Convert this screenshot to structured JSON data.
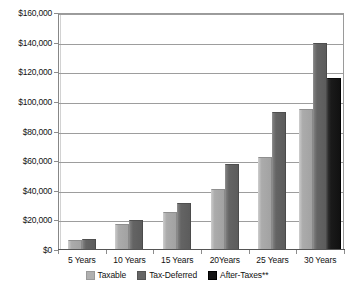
{
  "chart_data": {
    "type": "bar",
    "title": "",
    "subtitle": "",
    "xlabel": "",
    "ylabel": "",
    "categories": [
      "5 Years",
      "10 Years",
      "15 Years",
      "20Years",
      "25 Years",
      "30 Years"
    ],
    "series": [
      {
        "name": "Taxable",
        "color": "#a8a8a8",
        "values": [
          7000,
          17500,
          26000,
          41000,
          63000,
          95000
        ]
      },
      {
        "name": "Tax-Deferred",
        "color": "#646464",
        "values": [
          7500,
          20000,
          32000,
          58000,
          93000,
          140000
        ]
      },
      {
        "name": "After-Taxes**",
        "color": "#1a1a1a",
        "values": [
          null,
          null,
          null,
          null,
          null,
          116000
        ]
      }
    ],
    "ylim": [
      0,
      160000
    ],
    "ytick_values": [
      0,
      20000,
      40000,
      60000,
      80000,
      100000,
      120000,
      140000,
      160000
    ],
    "ytick_labels": [
      "$0",
      "$20,000",
      "$40,000",
      "$60,000",
      "$80,000",
      "$100,000",
      "$120,000",
      "$140,000",
      "$160,000"
    ],
    "grid": true,
    "grid_axis": "y",
    "legend_position": "bottom",
    "legend_entries": [
      "Taxable",
      "Tax-Deferred",
      "After-Taxes**"
    ]
  }
}
